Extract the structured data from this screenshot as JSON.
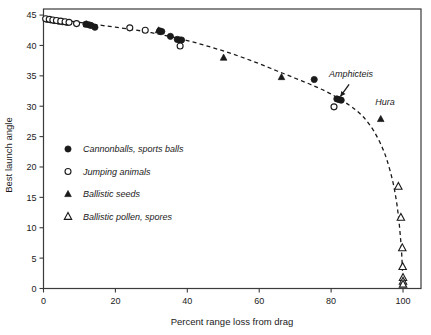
{
  "chart_data": {
    "type": "scatter",
    "title": "",
    "xlabel": "Percent range loss from drag",
    "ylabel": "Best launch angle",
    "xlim": [
      0,
      105
    ],
    "ylim": [
      0,
      46
    ],
    "xticks": [
      0,
      20,
      40,
      60,
      80,
      100
    ],
    "yticks": [
      0,
      5,
      10,
      15,
      20,
      25,
      30,
      35,
      40,
      45
    ],
    "grid": false,
    "legend_position": "center-left",
    "series": [
      {
        "name": "Cannonballs, sports balls",
        "marker": "filled-circle",
        "color": "#1a1a1a",
        "points": [
          [
            1.0,
            44.3
          ],
          [
            2.0,
            44.2
          ],
          [
            3.0,
            44.1
          ],
          [
            4.2,
            44.0
          ],
          [
            5.3,
            43.9
          ],
          [
            6.5,
            43.8
          ],
          [
            11.8,
            43.5
          ],
          [
            12.6,
            43.4
          ],
          [
            13.2,
            43.3
          ],
          [
            14.3,
            43.0
          ],
          [
            32.3,
            42.4
          ],
          [
            32.9,
            42.3
          ],
          [
            35.3,
            41.5
          ],
          [
            37.2,
            41.0
          ],
          [
            37.9,
            40.9
          ],
          [
            38.4,
            40.9
          ],
          [
            75.3,
            34.4
          ],
          [
            81.6,
            31.2
          ],
          [
            82.2,
            31.1
          ],
          [
            82.8,
            31.0
          ]
        ]
      },
      {
        "name": "Jumping animals",
        "marker": "open-circle",
        "color": "#1a1a1a",
        "points": [
          [
            0.6,
            44.4
          ],
          [
            1.6,
            44.3
          ],
          [
            2.6,
            44.2
          ],
          [
            3.6,
            44.1
          ],
          [
            4.8,
            44.0
          ],
          [
            6.0,
            43.9
          ],
          [
            7.1,
            43.8
          ],
          [
            9.2,
            43.6
          ],
          [
            24.0,
            42.9
          ],
          [
            28.3,
            42.5
          ],
          [
            38.0,
            39.9
          ],
          [
            80.8,
            29.9
          ]
        ]
      },
      {
        "name": "Ballistic seeds",
        "marker": "filled-triangle",
        "color": "#1a1a1a",
        "points": [
          [
            12.0,
            43.5
          ],
          [
            32.0,
            42.5
          ],
          [
            50.1,
            38.0
          ],
          [
            66.2,
            34.8
          ],
          [
            93.8,
            27.9
          ]
        ]
      },
      {
        "name": "Ballistic pollen, spores",
        "marker": "open-triangle",
        "color": "#1a1a1a",
        "points": [
          [
            98.7,
            16.8
          ],
          [
            99.4,
            11.7
          ],
          [
            99.8,
            6.7
          ],
          [
            99.9,
            3.6
          ],
          [
            100.0,
            1.8
          ],
          [
            100.0,
            1.2
          ],
          [
            100.0,
            0.7
          ]
        ]
      }
    ],
    "fit_curve": {
      "style": "dashed",
      "color": "#1a1a1a",
      "points": [
        [
          0,
          44.6
        ],
        [
          5,
          44.2
        ],
        [
          10,
          43.8
        ],
        [
          15,
          43.4
        ],
        [
          20,
          43.0
        ],
        [
          25,
          42.6
        ],
        [
          30,
          42.1
        ],
        [
          35,
          41.5
        ],
        [
          40,
          40.8
        ],
        [
          45,
          40.0
        ],
        [
          50,
          39.1
        ],
        [
          55,
          38.1
        ],
        [
          60,
          37.0
        ],
        [
          65,
          35.8
        ],
        [
          70,
          34.6
        ],
        [
          75,
          33.4
        ],
        [
          80,
          32.0
        ],
        [
          85,
          30.2
        ],
        [
          88,
          28.8
        ],
        [
          90,
          27.5
        ],
        [
          92,
          25.8
        ],
        [
          94,
          23.5
        ],
        [
          95.5,
          21.2
        ],
        [
          97,
          18.0
        ],
        [
          98,
          15.0
        ],
        [
          98.7,
          12.0
        ],
        [
          99.2,
          9.0
        ],
        [
          99.6,
          6.0
        ],
        [
          99.8,
          3.5
        ],
        [
          100,
          0.8
        ]
      ]
    },
    "annotations": [
      {
        "label": "Amphicteis",
        "label_x": 85.5,
        "label_y": 34.8,
        "arrow_from_x": 85.0,
        "arrow_from_y": 33.6,
        "arrow_to_x": 82.6,
        "arrow_to_y": 31.6,
        "has_arrow": true
      },
      {
        "label": "Hura",
        "label_x": 95.0,
        "label_y": 30.2,
        "has_arrow": false
      }
    ]
  },
  "legend": {
    "items": [
      {
        "label": "Cannonballs, sports balls",
        "marker": "filled-circle"
      },
      {
        "label": "Jumping animals",
        "marker": "open-circle"
      },
      {
        "label": "Ballistic seeds",
        "marker": "filled-triangle"
      },
      {
        "label": "Ballistic pollen, spores",
        "marker": "open-triangle"
      }
    ]
  }
}
